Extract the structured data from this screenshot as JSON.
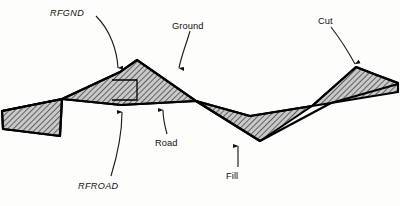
{
  "figure": {
    "kind": "engineering-cross-section",
    "colors": {
      "background": "#fdfdfc",
      "outline": "#000000",
      "hatch": "#3a3a3a",
      "hatch_fill": "#b9b9b9",
      "leader": "#2b2b2b",
      "text": "#111111"
    }
  },
  "labels": [
    {
      "id": "rfgnd",
      "text": "RFGND",
      "style": "italic",
      "x": 50,
      "y": 9
    },
    {
      "id": "ground",
      "text": "Ground",
      "style": "roman",
      "x": 172,
      "y": 22
    },
    {
      "id": "cut",
      "text": "Cut",
      "style": "roman",
      "x": 318,
      "y": 17
    },
    {
      "id": "road",
      "text": "Road",
      "style": "roman",
      "x": 155,
      "y": 139
    },
    {
      "id": "rfroad",
      "text": "RFROAD",
      "style": "italic",
      "x": 78,
      "y": 182
    },
    {
      "id": "fill",
      "text": "Fill",
      "style": "roman",
      "x": 226,
      "y": 172
    }
  ],
  "leaders": [
    {
      "id": "leader-rfgnd",
      "path": "M 97 17 C 112 30 118 52 118 69",
      "tip": [
        118,
        73
      ],
      "dir": "down"
    },
    {
      "id": "leader-ground",
      "path": "M 189 30 C 185 46 181 58 179 69",
      "tip": [
        178,
        73
      ],
      "dir": "down"
    },
    {
      "id": "leader-cut",
      "path": "M 330 26 C 340 40 348 54 355 66",
      "tip": [
        358,
        70
      ],
      "dir": "down"
    },
    {
      "id": "leader-road",
      "path": "M 167 133 C 164 122 163 114 163 108",
      "tip": [
        163,
        104
      ],
      "dir": "up"
    },
    {
      "id": "leader-rfroad",
      "path": "M 110 176 C 118 150 122 126 122 110",
      "tip": [
        122,
        106
      ],
      "dir": "up"
    },
    {
      "id": "leader-fill",
      "path": "M 238 166 C 238 157 238 150 238 144",
      "tip": [
        238,
        140
      ],
      "dir": "up"
    }
  ],
  "geometry": {
    "ground_line": "M 2 100 L 58 95 L 120 72 L 137 60 L 196 101 L 250 116 L 312 106 L 356 67 L 373 74 L 398 83",
    "road_line": "M 2 111 L 62 99 L 121 105 L 196 101 L 260 141 L 330 103 L 398 84",
    "regions": [
      {
        "id": "fill-left",
        "kind": "fill",
        "path": "M 2 111 L 62 99 L 120 100 L 196 101 L 62 99 L 2 111 L 3 128 L 62 136 Z"
      },
      {
        "id": "cut-center",
        "kind": "cut",
        "path": "M 62 99 L 120 72 L 137 60 L 196 101 L 121 105 Z"
      },
      {
        "id": "fill-right",
        "kind": "fill",
        "path": "M 196 101 L 250 116 L 312 106 L 260 141 Z"
      },
      {
        "id": "cut-right",
        "kind": "cut",
        "path": "M 312 106 L 356 67 L 373 74 L 398 83 L 398 93 L 330 103 Z"
      }
    ],
    "notch": {
      "id": "rfgnd-notch",
      "path": "M 110 80 L 137 80 L 137 99 L 110 99 Z"
    }
  }
}
